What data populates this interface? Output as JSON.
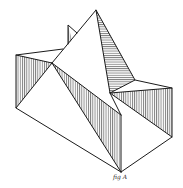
{
  "figure": {
    "caption": "fig A",
    "colors": {
      "ink": "#1a1a1a",
      "paper": "#ffffff"
    }
  }
}
